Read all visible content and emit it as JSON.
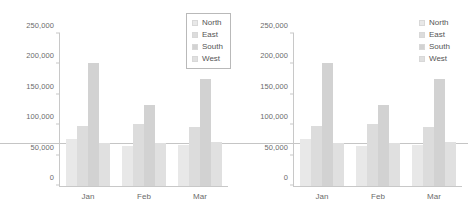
{
  "chart_data": [
    {
      "id": "left-chart",
      "type": "bar",
      "title": "",
      "subtitle": "",
      "xlabel": "",
      "ylabel": "",
      "categories": [
        "Jan",
        "Feb",
        "Mar"
      ],
      "series": [
        {
          "name": "North",
          "values": [
            77000,
            66000,
            67000
          ],
          "color": "#e8e8e8"
        },
        {
          "name": "East",
          "values": [
            99000,
            102000,
            97000
          ],
          "color": "#dcdcdc"
        },
        {
          "name": "South",
          "values": [
            203000,
            133000,
            176000
          ],
          "color": "#d2d2d2"
        },
        {
          "name": "West",
          "values": [
            71000,
            70000,
            72000
          ],
          "color": "#e0e0e0"
        }
      ],
      "ylim": [
        0,
        250000
      ],
      "yticks": [
        0,
        50000,
        100000,
        150000,
        200000,
        250000
      ],
      "ytick_labels": [
        "0",
        "50,000",
        "100,000",
        "150,000",
        "200,000",
        "250,000"
      ],
      "grid": false,
      "reference_line": 70000,
      "legend": {
        "position": "top-right-inside",
        "boxed": true,
        "entries": [
          "North",
          "East",
          "South",
          "West"
        ]
      }
    },
    {
      "id": "right-chart",
      "type": "bar",
      "title": "",
      "subtitle": "",
      "xlabel": "",
      "ylabel": "",
      "categories": [
        "Jan",
        "Feb",
        "Mar"
      ],
      "series": [
        {
          "name": "North",
          "values": [
            77000,
            66000,
            67000
          ],
          "color": "#e8e8e8"
        },
        {
          "name": "East",
          "values": [
            99000,
            102000,
            97000
          ],
          "color": "#dcdcdc"
        },
        {
          "name": "South",
          "values": [
            203000,
            133000,
            176000
          ],
          "color": "#d2d2d2"
        },
        {
          "name": "West",
          "values": [
            71000,
            70000,
            72000
          ],
          "color": "#e0e0e0"
        }
      ],
      "ylim": [
        0,
        250000
      ],
      "yticks": [
        0,
        50000,
        100000,
        150000,
        200000,
        250000
      ],
      "ytick_labels": [
        "0",
        "50,000",
        "100,000",
        "150,000",
        "200,000",
        "250,000"
      ],
      "grid": false,
      "reference_line": 70000,
      "legend": {
        "position": "top-right-outside",
        "boxed": false,
        "entries": [
          "North",
          "East",
          "South",
          "West"
        ]
      }
    }
  ],
  "colors": {
    "axis": "#c8c8c8",
    "reference_line": "#c5c5c5",
    "tick_text": "#6b6b6b",
    "legend_text": "#555555",
    "legend_border": "#b9b9b9",
    "background": "#ffffff"
  }
}
